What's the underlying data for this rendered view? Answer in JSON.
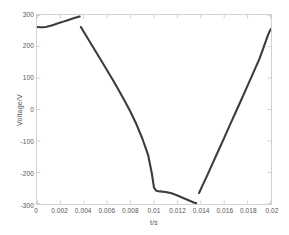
{
  "chart_data": {
    "type": "line",
    "title": "",
    "xlabel": "t/s",
    "ylabel": "Voltage/V",
    "xlim": [
      0,
      0.02
    ],
    "ylim": [
      -300,
      300
    ],
    "grid": false,
    "legend": null,
    "line_color": "#3c3c3c",
    "axis_color": "#d2d2d2",
    "tick_label_color": "#555555",
    "xticks": [
      {
        "value": 0,
        "label": "0"
      },
      {
        "value": 0.002,
        "label": "0.002"
      },
      {
        "value": 0.004,
        "label": "0.004"
      },
      {
        "value": 0.006,
        "label": "0.006"
      },
      {
        "value": 0.008,
        "label": "0.008"
      },
      {
        "value": 0.01,
        "label": "0.01"
      },
      {
        "value": 0.012,
        "label": "0.012"
      },
      {
        "value": 0.014,
        "label": "0.014"
      },
      {
        "value": 0.016,
        "label": "0.016"
      },
      {
        "value": 0.018,
        "label": "0.018"
      },
      {
        "value": 0.02,
        "label": "0.02"
      }
    ],
    "yticks": [
      {
        "value": 300,
        "label": "300"
      },
      {
        "value": 200,
        "label": "200"
      },
      {
        "value": 100,
        "label": "100"
      },
      {
        "value": 0,
        "label": "0"
      },
      {
        "value": -100,
        "label": "-100"
      },
      {
        "value": -200,
        "label": "-200"
      },
      {
        "value": -300,
        "label": "-300"
      }
    ],
    "series": [
      {
        "name": "Voltage",
        "segments": [
          {
            "name": "segment-1",
            "points": [
              [
                0.0,
                262
              ],
              [
                0.00025,
                261
              ],
              [
                0.0005,
                261
              ],
              [
                0.00075,
                262
              ],
              [
                0.001,
                264
              ],
              [
                0.00125,
                267
              ],
              [
                0.0015,
                270
              ],
              [
                0.00175,
                273
              ],
              [
                0.002,
                276
              ],
              [
                0.00225,
                279
              ],
              [
                0.0025,
                282
              ],
              [
                0.00275,
                285
              ],
              [
                0.003,
                288
              ],
              [
                0.00325,
                291
              ],
              [
                0.0035,
                294
              ],
              [
                0.00365,
                295
              ]
            ]
          },
          {
            "name": "segment-2",
            "points": [
              [
                0.00375,
                262
              ],
              [
                0.0045,
                216
              ],
              [
                0.0055,
                155
              ],
              [
                0.0065,
                93
              ],
              [
                0.007,
                60
              ],
              [
                0.0075,
                27
              ],
              [
                0.008,
                -8
              ],
              [
                0.0085,
                -47
              ],
              [
                0.009,
                -92
              ],
              [
                0.0095,
                -145
              ],
              [
                0.0098,
                -200
              ],
              [
                0.01,
                -248
              ],
              [
                0.0102,
                -258
              ],
              [
                0.0105,
                -260
              ],
              [
                0.011,
                -262
              ],
              [
                0.0115,
                -266
              ],
              [
                0.012,
                -273
              ],
              [
                0.0125,
                -281
              ],
              [
                0.013,
                -289
              ],
              [
                0.01345,
                -296
              ],
              [
                0.0136,
                -297
              ]
            ]
          },
          {
            "name": "segment-3",
            "points": [
              [
                0.01385,
                -265
              ],
              [
                0.0142,
                -237
              ],
              [
                0.0146,
                -205
              ],
              [
                0.015,
                -172
              ],
              [
                0.0155,
                -131
              ],
              [
                0.016,
                -90
              ],
              [
                0.0165,
                -48
              ],
              [
                0.017,
                -7
              ],
              [
                0.0175,
                34
              ],
              [
                0.018,
                76
              ],
              [
                0.0185,
                118
              ],
              [
                0.019,
                160
              ],
              [
                0.0193,
                190
              ],
              [
                0.0196,
                222
              ],
              [
                0.0198,
                242
              ],
              [
                0.02,
                256
              ]
            ]
          }
        ]
      }
    ]
  }
}
